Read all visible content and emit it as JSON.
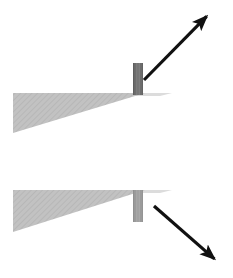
{
  "figure": {
    "width": 233,
    "height": 278,
    "background_color": "#ffffff",
    "panels": [
      {
        "id": "top-panel",
        "name": "upper-diagram",
        "ramp": {
          "name": "ramp-wedge",
          "fill_color": "#bebebe",
          "hatch_color": "#b2b2b2",
          "points": "13,93 145,93 13,133",
          "top_y": 93,
          "left_x": 13,
          "right_x": 145,
          "bottom_y": 133
        },
        "surface_shadow": {
          "name": "ramp-surface-shadow",
          "fill_color": "#dcdcdc",
          "points": "133,93 172,93 160,96 133,96"
        },
        "block": {
          "name": "block-on-ramp",
          "fill_color": "#7c7c7c",
          "stripe_color": "#6e6e6e",
          "edge_color": "#5a5a5a",
          "x": 133,
          "y": 63,
          "width": 10,
          "height": 32
        },
        "arrow": {
          "name": "force-arrow-up-right",
          "color": "#111111",
          "stroke_width": 3.2,
          "x1": 144,
          "y1": 80,
          "x2": 210,
          "y2": 13,
          "direction": "up-right",
          "head_length": 16,
          "head_width": 9
        }
      },
      {
        "id": "bottom-panel",
        "name": "lower-diagram",
        "ramp": {
          "name": "ramp-wedge",
          "fill_color": "#bebebe",
          "hatch_color": "#b2b2b2",
          "points": "13,190 145,190 13,232",
          "top_y": 190,
          "left_x": 13,
          "right_x": 145,
          "bottom_y": 232
        },
        "surface_shadow": {
          "name": "ramp-surface-shadow",
          "fill_color": "#dcdcdc",
          "points": "133,190 172,190 160,193 133,193"
        },
        "block": {
          "name": "block-on-ramp",
          "fill_color": "#a8a8a8",
          "stripe_color": "#9c9c9c",
          "edge_color": "#8a8a8a",
          "x": 133,
          "y": 190,
          "width": 10,
          "height": 32
        },
        "arrow": {
          "name": "force-arrow-down-right",
          "color": "#111111",
          "stroke_width": 3.2,
          "x1": 154,
          "y1": 206,
          "x2": 218,
          "y2": 262,
          "direction": "down-right",
          "head_length": 16,
          "head_width": 9
        }
      }
    ]
  }
}
